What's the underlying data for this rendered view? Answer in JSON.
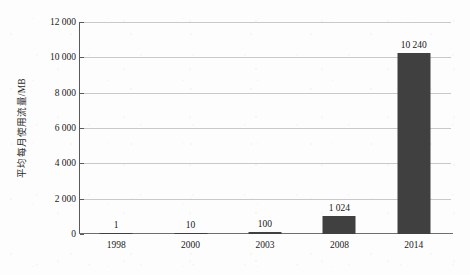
{
  "chart_data": {
    "type": "bar",
    "title": "",
    "subtitle": "",
    "xlabel": "",
    "ylabel": "平均每月使用流量/MB",
    "categories": [
      "1998",
      "2000",
      "2003",
      "2008",
      "2014"
    ],
    "values": [
      1,
      10,
      100,
      1024,
      10240
    ],
    "data_labels": [
      "1",
      "10",
      "100",
      "1 024",
      "10 240"
    ],
    "series": [
      {
        "name": "平均每月使用流量/MB",
        "values": [
          1,
          10,
          100,
          1024,
          10240
        ],
        "color": "#404040"
      }
    ],
    "ylim": [
      0,
      12000
    ],
    "y_tick_values": [
      0,
      2000,
      4000,
      6000,
      8000,
      10000,
      12000
    ],
    "y_tick_labels": [
      "0",
      "2 000",
      "4 000",
      "6 000",
      "8 000",
      "10 000",
      "12 000"
    ],
    "grid": true,
    "grid_axis": "y",
    "legend": false,
    "legend_position": "none",
    "annotations": []
  },
  "colors": {
    "bar": "#404040",
    "gridline": "#c9c9c9",
    "axis": "#595959",
    "baseline": "#6e6e6e",
    "text": "#1a1a1a",
    "background": "#fdfdfd"
  }
}
